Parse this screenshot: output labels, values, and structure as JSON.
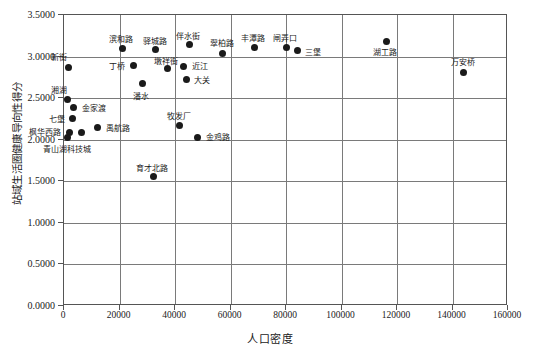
{
  "chart_data": {
    "type": "scatter",
    "title": "",
    "xlabel": "人口密度",
    "ylabel": "站域生活圈健康导向性得分",
    "xlim": [
      0,
      160000
    ],
    "ylim": [
      0,
      3.5
    ],
    "xticks": [
      "0",
      "20000",
      "40000",
      "60000",
      "80000",
      "100000",
      "120000",
      "140000",
      "160000"
    ],
    "yticks": [
      "0.0000",
      "0.5000",
      "1.0000",
      "1.5000",
      "2.0000",
      "2.5000",
      "3.0000",
      "3.5000"
    ],
    "grid": "both",
    "legend": "none",
    "marker_color": "#1a1a1a",
    "points": [
      {
        "label": "新街",
        "x": 2000,
        "y": 2.86,
        "lx": -10,
        "ly": -14,
        "anchor": "c"
      },
      {
        "label": "湘湖",
        "x": 1800,
        "y": 2.47,
        "lx": -9,
        "ly": -14,
        "anchor": "c"
      },
      {
        "label": "金家渡",
        "x": 3800,
        "y": 2.37,
        "lx": 8,
        "ly": -4,
        "anchor": "l"
      },
      {
        "label": "七堡",
        "x": 3600,
        "y": 2.24,
        "lx": -8,
        "ly": -4,
        "anchor": "r"
      },
      {
        "label": "枫华西路",
        "x": 2200,
        "y": 2.08,
        "lx": -8,
        "ly": -4,
        "anchor": "r"
      },
      {
        "label": "青山湖科技城",
        "x": 1500,
        "y": 2.02,
        "lx": 0,
        "ly": 8,
        "anchor": "c"
      },
      {
        "label": "",
        "x": 6500,
        "y": 2.08,
        "lx": 0,
        "ly": 0,
        "anchor": "c"
      },
      {
        "label": "禹航路",
        "x": 12500,
        "y": 2.13,
        "lx": 8,
        "ly": -4,
        "anchor": "l"
      },
      {
        "label": "滨和路",
        "x": 21500,
        "y": 3.09,
        "lx": -2,
        "ly": -13,
        "anchor": "c"
      },
      {
        "label": "丁桥",
        "x": 25500,
        "y": 2.88,
        "lx": -9,
        "ly": -4,
        "anchor": "r"
      },
      {
        "label": "潘水",
        "x": 28500,
        "y": 2.66,
        "lx": -1,
        "ly": 8,
        "anchor": "c"
      },
      {
        "label": "育才北路",
        "x": 32500,
        "y": 1.54,
        "lx": -1,
        "ly": -13,
        "anchor": "c"
      },
      {
        "label": "驿城路",
        "x": 33500,
        "y": 3.07,
        "lx": -1,
        "ly": -13,
        "anchor": "c"
      },
      {
        "label": "墩祥街",
        "x": 37500,
        "y": 2.85,
        "lx": -1,
        "ly": -11,
        "anchor": "c"
      },
      {
        "label": "近江",
        "x": 43500,
        "y": 2.87,
        "lx": 8,
        "ly": -4,
        "anchor": "l"
      },
      {
        "label": "伴水街",
        "x": 45500,
        "y": 3.13,
        "lx": -1,
        "ly": -13,
        "anchor": "c"
      },
      {
        "label": "大关",
        "x": 44500,
        "y": 2.71,
        "lx": 8,
        "ly": -4,
        "anchor": "l"
      },
      {
        "label": "牧发厂",
        "x": 42000,
        "y": 2.16,
        "lx": -1,
        "ly": -13,
        "anchor": "c"
      },
      {
        "label": "金鸡路",
        "x": 48500,
        "y": 2.02,
        "lx": 8,
        "ly": -4,
        "anchor": "l"
      },
      {
        "label": "翠柏路",
        "x": 57500,
        "y": 3.03,
        "lx": -1,
        "ly": -14,
        "anchor": "c"
      },
      {
        "label": "丰潭路",
        "x": 69000,
        "y": 3.1,
        "lx": -1,
        "ly": -13,
        "anchor": "c"
      },
      {
        "label": "闸弄口",
        "x": 80500,
        "y": 3.1,
        "lx": -1,
        "ly": -13,
        "anchor": "c"
      },
      {
        "label": "三堡",
        "x": 84500,
        "y": 3.06,
        "lx": 8,
        "ly": -3,
        "anchor": "l"
      },
      {
        "label": "湖工路",
        "x": 116500,
        "y": 3.17,
        "lx": -1,
        "ly": 7,
        "anchor": "c"
      },
      {
        "label": "万安桥",
        "x": 144500,
        "y": 2.8,
        "lx": -1,
        "ly": -14,
        "anchor": "c"
      }
    ]
  }
}
